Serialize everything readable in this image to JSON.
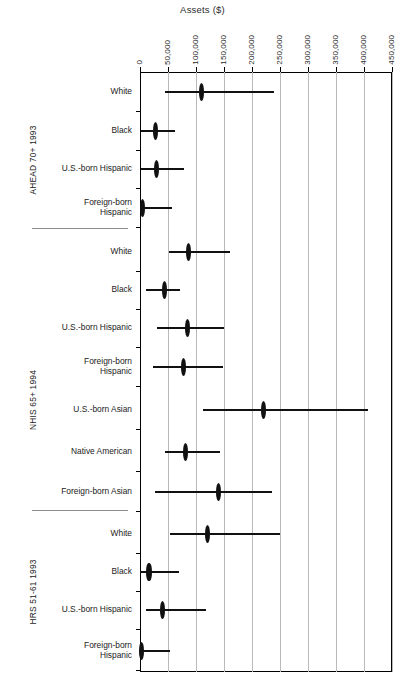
{
  "chart_data": {
    "type": "scatter",
    "title": "Assets ($)",
    "xlabel": "Assets ($)",
    "ylabel": "",
    "orientation": "horizontal",
    "plot_style": "point estimate with confidence interval (dot-and-whisker)",
    "xlim": [
      0,
      450000
    ],
    "xticks": [
      0,
      50000,
      100000,
      150000,
      200000,
      250000,
      300000,
      350000,
      400000,
      450000
    ],
    "xticklabels": [
      "0",
      "50,000",
      "100,000",
      "150,000",
      "200,000",
      "250,000",
      "300,000",
      "350,000",
      "400,000",
      "450,000"
    ],
    "grid": "vertical gridlines at each x tick",
    "legend": "none",
    "groups": [
      {
        "name": "AHEAD 70+ 1993",
        "rows": [
          {
            "label": "White",
            "estimate": 110000,
            "low": 45000,
            "high": 240000
          },
          {
            "label": "Black",
            "estimate": 27000,
            "low": 2000,
            "high": 63000
          },
          {
            "label": "U.S.-born Hispanic",
            "estimate": 30000,
            "low": 1000,
            "high": 78000
          },
          {
            "label": "Foreign-born\nHispanic",
            "estimate": 4000,
            "low": 0,
            "high": 57000
          }
        ]
      },
      {
        "name": "NHIS 65+ 1994",
        "rows": [
          {
            "label": "White",
            "estimate": 86000,
            "low": 52000,
            "high": 160000
          },
          {
            "label": "Black",
            "estimate": 44000,
            "low": 10000,
            "high": 72000
          },
          {
            "label": "U.S.-born Hispanic",
            "estimate": 85000,
            "low": 31000,
            "high": 150000
          },
          {
            "label": "Foreign-born\nHispanic",
            "estimate": 77000,
            "low": 23000,
            "high": 148000
          },
          {
            "label": "U.S.-born Asian",
            "estimate": 220000,
            "low": 112000,
            "high": 407000
          },
          {
            "label": "Native American",
            "estimate": 81000,
            "low": 45000,
            "high": 142000
          },
          {
            "label": "Foreign-born Asian",
            "estimate": 140000,
            "low": 27000,
            "high": 235000
          }
        ]
      },
      {
        "name": "HRS 51-61 1993",
        "rows": [
          {
            "label": "White",
            "estimate": 121000,
            "low": 53000,
            "high": 250000
          },
          {
            "label": "Black",
            "estimate": 16000,
            "low": 0,
            "high": 70000
          },
          {
            "label": "U.S.-born Hispanic",
            "estimate": 40000,
            "low": 10000,
            "high": 118000
          },
          {
            "label": "Foreign-born\nHispanic",
            "estimate": 3000,
            "low": 0,
            "high": 54000
          }
        ]
      }
    ]
  },
  "layout": {
    "plot_left": 140,
    "plot_right": 392,
    "plot_top": 72,
    "plot_bottom": 672,
    "row_positions": [
      92,
      131,
      169,
      208,
      252,
      290,
      328,
      367,
      410,
      452,
      492,
      534,
      572,
      610,
      651
    ],
    "group_rule_positions": [
      228,
      510
    ],
    "group_rule_left": 32,
    "group_rule_right": 128,
    "group_label_centers": [
      160,
      400,
      592
    ],
    "colors": {
      "marker": "#111111",
      "axis": "#000000",
      "gridline": "#b9b9b9",
      "text": "#222222",
      "background": "#ffffff"
    }
  }
}
